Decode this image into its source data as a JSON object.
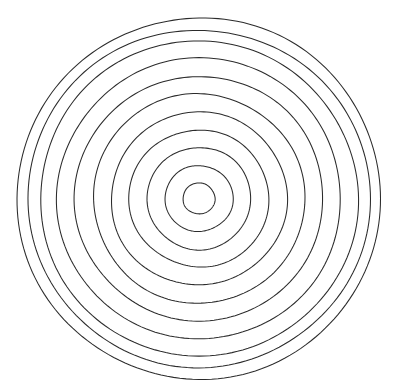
{
  "figure": {
    "background_color": "#ffffff",
    "stroke_color": "#2b2b2b",
    "fill": "none",
    "stroke_width": 1.05,
    "canvas": {
      "width": 406,
      "height": 392
    }
  },
  "chart_data": {
    "type": "scatter",
    "title": "",
    "subtitle": "",
    "xlabel": "",
    "ylabel": "",
    "grid": false,
    "legend": null,
    "axis_visible": false,
    "tick_labels": [],
    "annotations": [],
    "shape": "concentric-circles",
    "ring_count": 11,
    "center": {
      "x": 199,
      "y": 198.5
    },
    "xlim": [
      0,
      406
    ],
    "ylim": [
      0,
      392
    ],
    "rings": [
      {
        "index": 1,
        "rx": 16,
        "ry": 15.5,
        "rotation": -4
      },
      {
        "index": 2,
        "rx": 34,
        "ry": 33,
        "rotation": 3
      },
      {
        "index": 3,
        "rx": 52,
        "ry": 51,
        "rotation": -6
      },
      {
        "index": 4,
        "rx": 70,
        "ry": 68.5,
        "rotation": 5
      },
      {
        "index": 5,
        "rx": 88,
        "ry": 86.5,
        "rotation": -3
      },
      {
        "index": 6,
        "rx": 106,
        "ry": 104.5,
        "rotation": 7
      },
      {
        "index": 7,
        "rx": 124,
        "ry": 122.5,
        "rotation": -5
      },
      {
        "index": 8,
        "rx": 142,
        "ry": 140.5,
        "rotation": 4
      },
      {
        "index": 9,
        "rx": 159,
        "ry": 157.5,
        "rotation": -2
      },
      {
        "index": 10,
        "rx": 171,
        "ry": 169,
        "rotation": 6
      },
      {
        "index": 11,
        "rx": 182,
        "ry": 180.5,
        "rotation": -4
      }
    ]
  }
}
